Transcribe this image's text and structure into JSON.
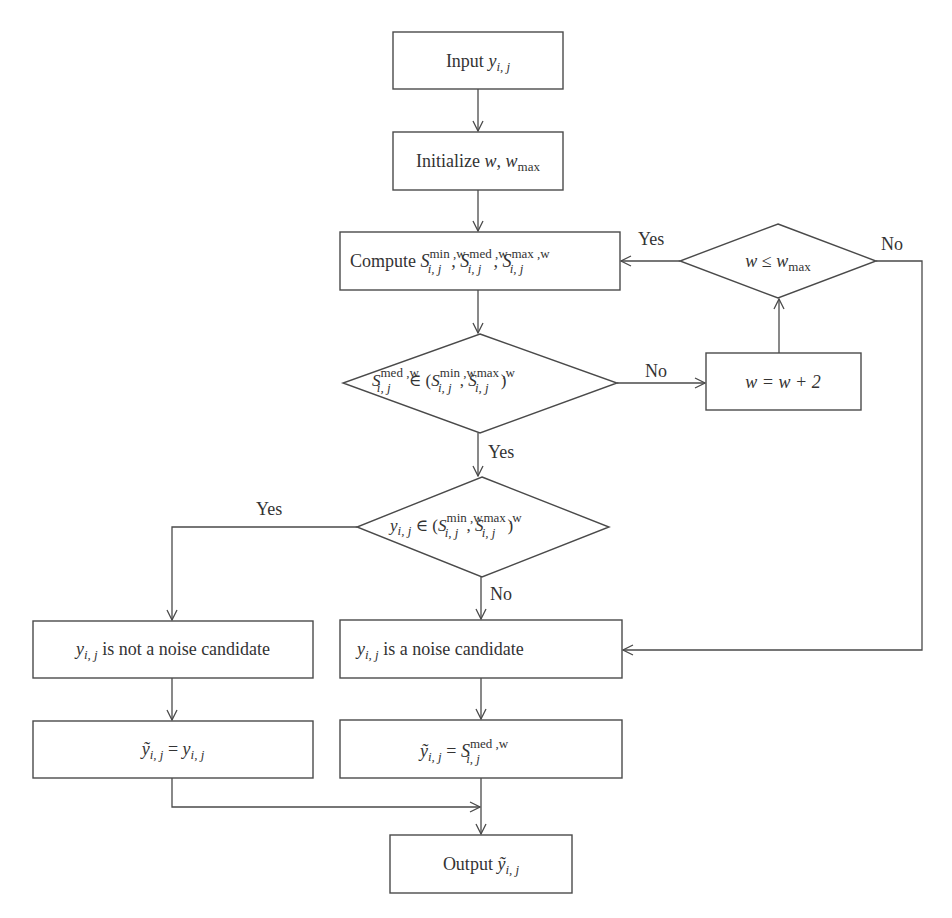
{
  "diagram": {
    "type": "flowchart",
    "colors": {
      "stroke": "#4a4a4a",
      "text": "#333333",
      "background": "#ffffff"
    },
    "nodes": {
      "input": {
        "shape": "rect",
        "prefix": "Input ",
        "var": "y",
        "sub": "i, j"
      },
      "init": {
        "shape": "rect",
        "prefix": "Initialize ",
        "var1": "w",
        "sep": ", ",
        "var2": "w",
        "var2_sub": "max"
      },
      "compute": {
        "shape": "rect",
        "prefix": "Compute ",
        "S": "S",
        "sub": "i, j",
        "sup_min": "min ,w",
        "sup_med": "med ,w",
        "sup_max": "max ,w",
        "sep": ", "
      },
      "check_wmax": {
        "shape": "diamond",
        "lhs": "w",
        "op": " ≤ ",
        "rhs": "w",
        "rhs_sub": "max"
      },
      "check_med": {
        "shape": "diamond",
        "S": "S",
        "sub": "i, j",
        "sup_med": "med ,w",
        "sup_min": "min ,w",
        "sup_max": "max ,w",
        "op": " ∈ (",
        "comma": ", ",
        "close": ")"
      },
      "increment": {
        "shape": "rect",
        "text": "w = w + 2"
      },
      "check_y": {
        "shape": "diamond",
        "y": "y",
        "sub": "i, j",
        "S": "S",
        "sup_min": "min ,w",
        "sup_max": "max ,w",
        "op": " ∈ (",
        "comma": ", ",
        "close": ")"
      },
      "not_noise": {
        "shape": "rect",
        "var": "y",
        "sub": "i, j",
        "text": " is not a noise candidate"
      },
      "noise": {
        "shape": "rect",
        "var": "y",
        "sub": "i, j",
        "text": " is a noise candidate"
      },
      "assign_y": {
        "shape": "rect",
        "lhs": "ỹ",
        "lhs_sub": "i, j",
        "eq": " = ",
        "rhs": "y",
        "rhs_sub": "i, j"
      },
      "assign_med": {
        "shape": "rect",
        "lhs": "ỹ",
        "lhs_sub": "i, j",
        "eq": " = ",
        "S": "S",
        "sub": "i, j",
        "sup": "med ,w"
      },
      "output": {
        "shape": "rect",
        "prefix": "Output ",
        "var": "ỹ",
        "sub": "i, j"
      }
    },
    "edge_labels": {
      "wmax_yes": "Yes",
      "wmax_no": "No",
      "med_no": "No",
      "med_yes": "Yes",
      "y_yes": "Yes",
      "y_no": "No"
    },
    "edges": [
      {
        "from": "input",
        "to": "init"
      },
      {
        "from": "init",
        "to": "compute"
      },
      {
        "from": "compute",
        "to": "check_med"
      },
      {
        "from": "check_med",
        "to": "increment",
        "label": "No"
      },
      {
        "from": "increment",
        "to": "check_wmax"
      },
      {
        "from": "check_wmax",
        "to": "compute",
        "label": "Yes"
      },
      {
        "from": "check_wmax",
        "to": "noise",
        "label": "No"
      },
      {
        "from": "check_med",
        "to": "check_y",
        "label": "Yes"
      },
      {
        "from": "check_y",
        "to": "not_noise",
        "label": "Yes"
      },
      {
        "from": "check_y",
        "to": "noise",
        "label": "No"
      },
      {
        "from": "not_noise",
        "to": "assign_y"
      },
      {
        "from": "noise",
        "to": "assign_med"
      },
      {
        "from": "assign_y",
        "to": "output"
      },
      {
        "from": "assign_med",
        "to": "output"
      }
    ]
  }
}
